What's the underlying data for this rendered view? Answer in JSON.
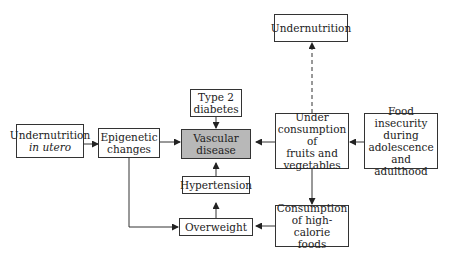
{
  "diagram": {
    "nodes": {
      "undernutrition_top": {
        "lines": [
          "Undernutrition"
        ]
      },
      "type2_diabetes": {
        "lines": [
          "Type 2",
          "diabetes"
        ]
      },
      "undernutrition_utero": {
        "lines": [
          "Undernutrition"
        ],
        "italic": "in utero"
      },
      "epigenetic": {
        "lines": [
          "Epigenetic",
          "changes"
        ]
      },
      "vascular": {
        "lines": [
          "Vascular",
          "disease"
        ]
      },
      "under_consumption": {
        "lines": [
          "Under",
          "consumption of",
          "fruits and",
          "vegetables"
        ]
      },
      "food_insecurity": {
        "lines": [
          "Food insecurity",
          "during",
          "adolescence",
          "and adulthood"
        ]
      },
      "hypertension": {
        "lines": [
          "Hypertension"
        ]
      },
      "overweight": {
        "lines": [
          "Overweight"
        ]
      },
      "high_calorie": {
        "lines": [
          "Consumption",
          "of high-calorie",
          "foods"
        ]
      }
    },
    "edges": [
      {
        "from": "undernutrition_utero",
        "to": "epigenetic",
        "style": "solid"
      },
      {
        "from": "epigenetic",
        "to": "vascular",
        "style": "solid"
      },
      {
        "from": "epigenetic",
        "to": "overweight",
        "style": "solid"
      },
      {
        "from": "type2_diabetes",
        "to": "vascular",
        "style": "solid"
      },
      {
        "from": "hypertension",
        "to": "vascular",
        "style": "solid"
      },
      {
        "from": "overweight",
        "to": "hypertension",
        "style": "solid"
      },
      {
        "from": "under_consumption",
        "to": "vascular",
        "style": "solid"
      },
      {
        "from": "under_consumption",
        "to": "undernutrition_top",
        "style": "dashed"
      },
      {
        "from": "food_insecurity",
        "to": "under_consumption",
        "style": "solid"
      },
      {
        "from": "under_consumption",
        "to": "high_calorie",
        "style": "solid"
      },
      {
        "from": "high_calorie",
        "to": "overweight",
        "style": "solid"
      }
    ],
    "colors": {
      "vascular_fill": "#b8b8b8",
      "line": "#333333"
    }
  }
}
